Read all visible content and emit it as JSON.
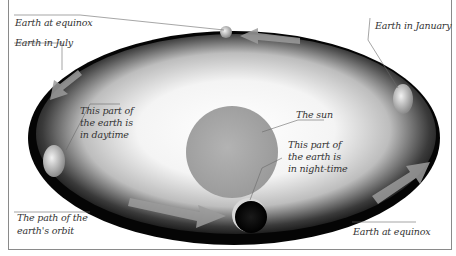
{
  "diagram": {
    "labels": {
      "equinox_top": "Earth at equinox",
      "july": "Earth in July",
      "january": "Earth in January",
      "sun": "The sun",
      "daytime_line1": "This part of",
      "daytime_line2": "the earth is",
      "daytime_line3": "in daytime",
      "night_line1": "This part of",
      "night_line2": "the earth is",
      "night_line3": "in night-time",
      "orbit_line1": "The path of the",
      "orbit_line2": "earth's orbit",
      "equinox_bottom": "Earth at equinox"
    },
    "colors": {
      "orbit_dark": "#0a0a0a",
      "glow_center": "#ffffff",
      "sun_fill": "#a8a8a8",
      "arrow": "#9a9a9a",
      "leader_line": "#6a6a6a",
      "text": "#333333"
    }
  }
}
